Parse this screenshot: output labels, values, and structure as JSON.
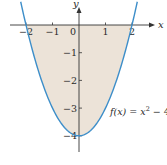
{
  "chart_data": {
    "type": "area",
    "title": "",
    "function_label": "f(x) = x² − 4",
    "function_label_parts": {
      "prefix": "f(x) = x",
      "exponent": "2",
      "suffix": " − 4"
    },
    "xlabel": "x",
    "ylabel": "y",
    "x_ticks": [
      -2,
      -1,
      0,
      1,
      2
    ],
    "x_tick_labels": [
      "−2",
      "−1",
      "0",
      "1",
      "2"
    ],
    "y_ticks": [
      -1,
      -2,
      -3,
      -4
    ],
    "y_tick_labels": [
      "−1",
      "−2",
      "−3",
      "−4"
    ],
    "xlim": [
      -2.9,
      3.2
    ],
    "ylim": [
      -4.6,
      0.9
    ],
    "grid": false,
    "legend": "none",
    "shaded_region": "region between f(x) = x^2 - 4 and the x-axis on [-2, 2]",
    "series": [
      {
        "name": "f(x) = x^2 - 4",
        "x": [
          -2.2,
          -2,
          -1.5,
          -1,
          -0.5,
          0,
          0.5,
          1,
          1.5,
          2,
          2.2
        ],
        "y": [
          0.84,
          0,
          -1.75,
          -3,
          -3.75,
          -4,
          -3.75,
          -3,
          -1.75,
          0,
          0.84
        ]
      }
    ],
    "colors": {
      "curve": "#3d8ec9",
      "fill": "#ece3d8",
      "axis": "#333333"
    }
  }
}
